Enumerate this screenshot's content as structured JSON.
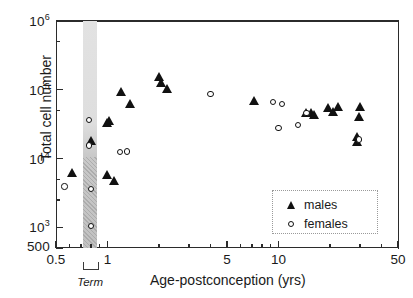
{
  "chart_data": {
    "type": "scatter",
    "title": "",
    "xlabel": "Age-postconception  (yrs)",
    "ylabel": "Total cell number",
    "xscale": "log",
    "yscale": "log",
    "xlim": [
      0.5,
      50
    ],
    "ylim": [
      500,
      1000000
    ],
    "grid": false,
    "legend_position": "lower right",
    "x_ticks_major": [
      {
        "value": 0.5,
        "label": "0.5"
      },
      {
        "value": 1,
        "label": "1"
      },
      {
        "value": 5,
        "label": "5"
      },
      {
        "value": 10,
        "label": "10"
      },
      {
        "value": 50,
        "label": "50"
      }
    ],
    "x_ticks_minor": [
      0.6,
      0.7,
      0.8,
      0.9,
      2,
      3,
      4,
      6,
      7,
      8,
      9,
      20,
      30,
      40
    ],
    "y_ticks_major": [
      {
        "value": 1000000,
        "label": "10",
        "exponent": "6"
      },
      {
        "value": 100000,
        "label": "10",
        "exponent": "5"
      },
      {
        "value": 10000,
        "label": "10",
        "exponent": "4"
      },
      {
        "value": 1000,
        "label": "10",
        "exponent": "3"
      },
      {
        "value": 500,
        "label": "500",
        "exponent": ""
      }
    ],
    "y_ticks_minor": [
      500000,
      50000,
      5000,
      2500
    ],
    "annotations": [
      {
        "name": "term-band",
        "label": "Term",
        "x_start": 0.72,
        "x_end": 0.87,
        "type": "vertical-shaded-band"
      }
    ],
    "series": [
      {
        "name": "males",
        "marker": "filled-triangle",
        "color": "#111111",
        "points": [
          [
            0.62,
            6200
          ],
          [
            0.8,
            18000
          ],
          [
            1.0,
            33000
          ],
          [
            1.02,
            35000
          ],
          [
            1.0,
            5900
          ],
          [
            1.1,
            4700
          ],
          [
            1.2,
            95000
          ],
          [
            1.35,
            62000
          ],
          [
            2.0,
            155000
          ],
          [
            2.05,
            125000
          ],
          [
            2.25,
            105000
          ],
          [
            7.2,
            69000
          ],
          [
            14.5,
            46000
          ],
          [
            15.5,
            47000
          ],
          [
            16.2,
            44000
          ],
          [
            19.5,
            55000
          ],
          [
            21.0,
            48000
          ],
          [
            22.5,
            57000
          ],
          [
            30.0,
            57000
          ],
          [
            29.5,
            40000
          ],
          [
            29.0,
            21000
          ],
          [
            28.8,
            17500
          ]
        ]
      },
      {
        "name": "females",
        "marker": "open-circle",
        "color": "#111111",
        "points": [
          [
            0.56,
            3900
          ],
          [
            0.78,
            36000
          ],
          [
            0.78,
            15500
          ],
          [
            0.8,
            3600
          ],
          [
            0.8,
            1050
          ],
          [
            1.18,
            12500
          ],
          [
            1.3,
            12700
          ],
          [
            4.0,
            87000
          ],
          [
            9.3,
            66000
          ],
          [
            10.5,
            62000
          ],
          [
            10.0,
            28000
          ],
          [
            13.0,
            31000
          ],
          [
            14.6,
            46000
          ],
          [
            29.6,
            19000
          ]
        ]
      }
    ]
  },
  "legend": {
    "entries": [
      {
        "label": "males",
        "marker": "filled-triangle"
      },
      {
        "label": "females",
        "marker": "open-circle"
      }
    ]
  },
  "colors": {
    "axis": "#2b2b2b",
    "marker": "#111111",
    "band": "#d8d8d8",
    "legend_border": "#9a9a9a"
  }
}
